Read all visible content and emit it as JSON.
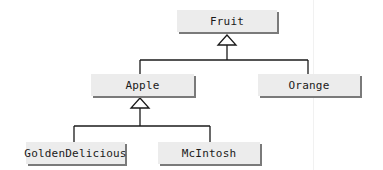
{
  "diagram": {
    "type": "uml-class-inheritance",
    "classes": [
      {
        "id": "fruit",
        "label": "Fruit"
      },
      {
        "id": "apple",
        "label": "Apple"
      },
      {
        "id": "orange",
        "label": "Orange"
      },
      {
        "id": "golden",
        "label": "GoldenDelicious"
      },
      {
        "id": "mcintosh",
        "label": "McIntosh"
      }
    ],
    "relationships": [
      {
        "child": "Apple",
        "parent": "Fruit",
        "kind": "generalization"
      },
      {
        "child": "Orange",
        "parent": "Fruit",
        "kind": "generalization"
      },
      {
        "child": "GoldenDelicious",
        "parent": "Apple",
        "kind": "generalization"
      },
      {
        "child": "McIntosh",
        "parent": "Apple",
        "kind": "generalization"
      }
    ],
    "colors": {
      "box_fill": "#ececec",
      "box_shadow": "#7a7a7a",
      "line": "#1a1a1a"
    }
  }
}
